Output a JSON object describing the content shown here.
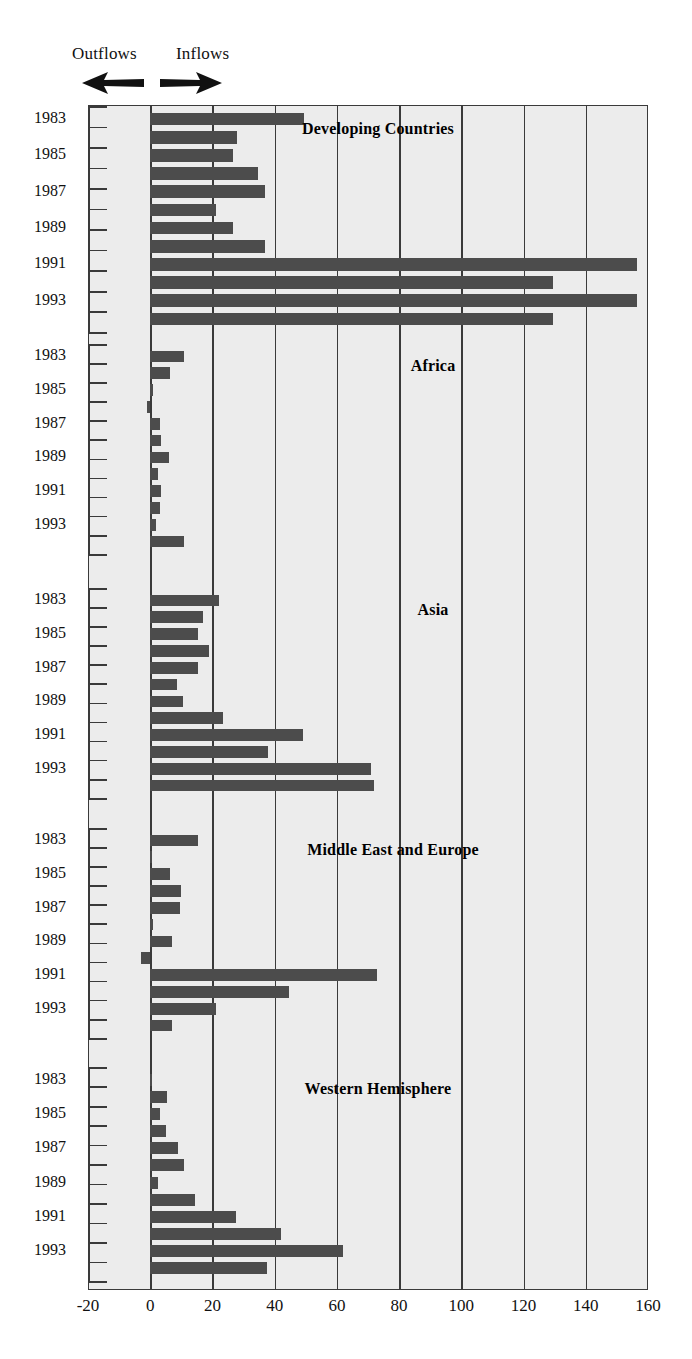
{
  "legend": {
    "outflows_label": "Outflows",
    "inflows_label": "Inflows",
    "left_arrow_icon": "arrow-left-icon",
    "right_arrow_icon": "arrow-right-icon"
  },
  "axis": {
    "x_ticks": [
      -20,
      0,
      20,
      40,
      60,
      80,
      100,
      120,
      140,
      160
    ],
    "x_tick_labels": [
      "-20",
      "0",
      "20",
      "40",
      "60",
      "80",
      "100",
      "120",
      "140",
      "160"
    ],
    "xmin": -20,
    "xmax": 160,
    "year_labels": [
      "1983",
      "1985",
      "1987",
      "1989",
      "1991",
      "1993"
    ],
    "years": [
      1983,
      1984,
      1985,
      1986,
      1987,
      1988,
      1989,
      1990,
      1991,
      1992,
      1993
    ]
  },
  "style": {
    "bar_color": "#4c4c4c",
    "panel_background": "#ececec",
    "axis_color": "#3a3a3a",
    "page_background": "#ffffff"
  },
  "chart_data": {
    "type": "bar",
    "orientation": "horizontal",
    "title": "",
    "xlabel": "",
    "ylabel": "",
    "xlim": [
      -20,
      160
    ],
    "grid": true,
    "grid_axis": "x",
    "legend_position": "top-left",
    "annotations": [
      "Outflows",
      "Inflows"
    ],
    "categories": [
      1983,
      1984,
      1985,
      1986,
      1987,
      1988,
      1989,
      1990,
      1991,
      1992,
      1993
    ],
    "panels": [
      {
        "name": "Developing Countries",
        "values": [
          49.5,
          28.0,
          26.5,
          34.5,
          37.0,
          21.0,
          26.5,
          37.0,
          156.5,
          129.5,
          156.5,
          129.5
        ],
        "series": [
          {
            "name": "Developing Countries",
            "categories": [
              1983,
              1984,
              1985,
              1986,
              1987,
              1988,
              1989,
              1990,
              1991,
              1992,
              1993
            ],
            "values": [
              49.5,
              28.0,
              26.5,
              34.5,
              37.0,
              21.0,
              26.5,
              37.0,
              156.5,
              129.5,
              156.5
            ]
          }
        ]
      },
      {
        "name": "Africa",
        "series": [
          {
            "name": "Africa",
            "categories": [
              1983,
              1984,
              1985,
              1986,
              1987,
              1988,
              1989,
              1990,
              1991,
              1992,
              1993
            ],
            "values": [
              11.0,
              6.5,
              1.0,
              -1.0,
              3.0,
              3.5,
              6.0,
              2.5,
              3.5,
              3.0,
              2.0
            ]
          }
        ]
      },
      {
        "name": "Asia",
        "series": [
          {
            "name": "Asia",
            "categories": [
              1983,
              1984,
              1985,
              1986,
              1987,
              1988,
              1989,
              1990,
              1991,
              1992,
              1993
            ],
            "values": [
              22.0,
              17.0,
              15.5,
              19.0,
              15.5,
              8.5,
              10.5,
              23.5,
              49.0,
              38.0,
              71.0
            ]
          }
        ]
      },
      {
        "name": "Middle East and Europe",
        "series": [
          {
            "name": "Middle East and Europe",
            "categories": [
              1983,
              1984,
              1985,
              1986,
              1987,
              1988,
              1989,
              1990,
              1991,
              1992,
              1993
            ],
            "values": [
              15.5,
              0.5,
              6.5,
              10.0,
              9.5,
              1.0,
              7.0,
              -3.0,
              73.0,
              44.5,
              21.0
            ]
          }
        ]
      },
      {
        "name": "Western Hemisphere",
        "series": [
          {
            "name": "Western Hemisphere",
            "categories": [
              1983,
              1984,
              1985,
              1986,
              1987,
              1988,
              1989,
              1990,
              1991,
              1992,
              1993
            ],
            "values": [
              0.5,
              5.5,
              3.0,
              5.0,
              9.0,
              11.0,
              2.5,
              14.5,
              27.5,
              42.0,
              62.0
            ]
          }
        ]
      }
    ],
    "panel_extra_bars": {
      "Developing Countries": 129.5,
      "Africa": 11.0,
      "Asia": 72.0,
      "Middle East and Europe": 7.0,
      "Western Hemisphere": 37.5
    }
  }
}
